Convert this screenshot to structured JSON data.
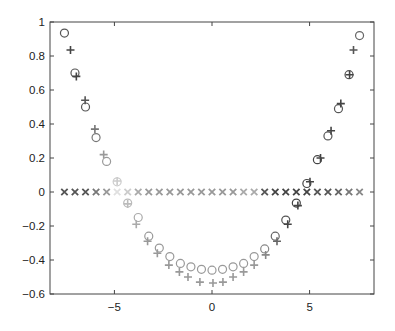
{
  "chart_data": {
    "type": "scatter",
    "title": "",
    "xlabel": "",
    "ylabel": "",
    "xlim": [
      -8.3,
      8.3
    ],
    "ylim": [
      -0.6,
      1.0
    ],
    "grid": false,
    "legend": null,
    "x_ticks": [
      -5,
      0,
      5
    ],
    "x_tick_labels": [
      "−5",
      "0",
      "5"
    ],
    "y_ticks": [
      1,
      0.8,
      0.6,
      0.4,
      0.2,
      0,
      -0.2,
      -0.4,
      -0.6
    ],
    "y_tick_labels": [
      "1",
      "0.8",
      "0.6",
      "0.4",
      "0.2",
      "0",
      "−0.2",
      "−0.4",
      "−0.6"
    ],
    "series": [
      {
        "name": "circles",
        "marker": "o",
        "x": [
          -7.56,
          -7.02,
          -6.48,
          -5.94,
          -5.4,
          -4.86,
          -4.32,
          -3.78,
          -3.24,
          -2.7,
          -2.16,
          -1.62,
          -1.08,
          -0.54,
          0.0,
          0.54,
          1.08,
          1.62,
          2.16,
          2.7,
          3.24,
          3.78,
          4.32,
          4.86,
          5.4,
          5.94,
          6.48,
          7.02,
          7.56
        ],
        "values": [
          0.935,
          0.7,
          0.5,
          0.32,
          0.18,
          0.06,
          -0.065,
          -0.15,
          -0.26,
          -0.33,
          -0.38,
          -0.42,
          -0.44,
          -0.455,
          -0.46,
          -0.455,
          -0.44,
          -0.42,
          -0.38,
          -0.335,
          -0.26,
          -0.165,
          -0.065,
          0.05,
          0.19,
          0.33,
          0.49,
          0.69,
          0.92
        ],
        "shades": [
          "#555",
          "#555",
          "#555",
          "#777",
          "#999",
          "#ccc",
          "#bbb",
          "#aaa",
          "#999",
          "#999",
          "#999",
          "#999",
          "#999",
          "#999",
          "#999",
          "#999",
          "#999",
          "#999",
          "#999",
          "#888",
          "#666",
          "#555",
          "#444",
          "#444",
          "#444",
          "#555",
          "#555",
          "#555",
          "#666"
        ]
      },
      {
        "name": "pluses",
        "marker": "+",
        "x": [
          -7.25,
          -6.95,
          -6.5,
          -6.0,
          -5.55,
          -4.86,
          -4.32,
          -3.88,
          -3.3,
          -2.8,
          -2.21,
          -1.67,
          -1.23,
          -0.62,
          0.05,
          0.56,
          1.08,
          1.62,
          2.16,
          2.75,
          3.33,
          3.88,
          4.4,
          5.02,
          5.56,
          6.1,
          6.6,
          7.05,
          7.25
        ],
        "values": [
          0.835,
          0.68,
          0.54,
          0.37,
          0.22,
          0.065,
          -0.07,
          -0.19,
          -0.29,
          -0.36,
          -0.43,
          -0.47,
          -0.5,
          -0.53,
          -0.535,
          -0.53,
          -0.5,
          -0.47,
          -0.43,
          -0.37,
          -0.29,
          -0.19,
          -0.08,
          0.06,
          0.2,
          0.36,
          0.52,
          0.69,
          0.835
        ],
        "shades": [
          "#444",
          "#444",
          "#555",
          "#777",
          "#999",
          "#ccc",
          "#bbb",
          "#aaa",
          "#999",
          "#999",
          "#999",
          "#999",
          "#999",
          "#999",
          "#999",
          "#999",
          "#999",
          "#999",
          "#999",
          "#888",
          "#666",
          "#444",
          "#444",
          "#444",
          "#444",
          "#444",
          "#444",
          "#444",
          "#555"
        ]
      },
      {
        "name": "crosses",
        "marker": "x",
        "x": [
          -7.56,
          -7.02,
          -6.48,
          -5.94,
          -5.4,
          -4.86,
          -4.32,
          -3.78,
          -3.24,
          -2.7,
          -2.16,
          -1.62,
          -1.08,
          -0.54,
          0.0,
          0.54,
          1.08,
          1.62,
          2.16,
          2.7,
          3.24,
          3.78,
          4.32,
          4.86,
          5.4,
          5.94,
          6.48,
          7.02,
          7.56
        ],
        "values": [
          0,
          0,
          0,
          0,
          0,
          0,
          0,
          0,
          0,
          0,
          0,
          0,
          0,
          0,
          0,
          0,
          0,
          0,
          0,
          0,
          0,
          0,
          0,
          0,
          0,
          0,
          0,
          0,
          0
        ],
        "shades": [
          "#555",
          "#555",
          "#555",
          "#777",
          "#999",
          "#e0e0e0",
          "#ccc",
          "#aaa",
          "#999",
          "#999",
          "#999",
          "#999",
          "#999",
          "#999",
          "#999",
          "#999",
          "#999",
          "#aaa",
          "#aaa",
          "#555",
          "#444",
          "#444",
          "#444",
          "#444",
          "#555",
          "#555",
          "#666",
          "#777",
          "#888"
        ]
      }
    ]
  },
  "layout": {
    "plot_left": 50,
    "plot_top": 22,
    "plot_right": 374,
    "plot_bottom": 294
  }
}
